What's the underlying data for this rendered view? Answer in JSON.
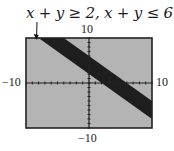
{
  "chart_data": {
    "type": "area",
    "title": "x + y ≥ 2, x + y ≤ 6",
    "xlabel": "",
    "ylabel": "",
    "xlim": [
      -10,
      10
    ],
    "ylim": [
      -10,
      10
    ],
    "grid": false,
    "tick_labels": {
      "x_min": "−10",
      "x_max": "10",
      "y_min": "−10",
      "y_max": "10"
    },
    "series": [
      {
        "name": "x + y ≥ 2 and x + y ≤ 6 (shaded band)",
        "boundaries": [
          {
            "equation": "x + y = 2",
            "points": [
              [
                -8,
                10
              ],
              [
                10,
                -8
              ]
            ]
          },
          {
            "equation": "x + y = 6",
            "points": [
              [
                -4,
                10
              ],
              [
                10,
                -4
              ]
            ]
          }
        ],
        "fill": "#1e1e1e"
      }
    ],
    "background": "#b4b4b4",
    "annotations": [
      {
        "text": "x + y ≥ 2, x + y ≤ 6",
        "arrow_to": [
          -8,
          10
        ]
      }
    ]
  }
}
